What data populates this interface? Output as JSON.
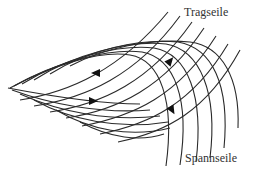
{
  "diagram": {
    "title": "",
    "labels": {
      "top": "Tragseile",
      "bottom": "Spannseile"
    },
    "colors": {
      "line": "#2a2a2a",
      "arrow": "#111111",
      "text": "#333333",
      "background": "#ffffff"
    },
    "tragseile_paths": [
      "M 10 88 C 60 92, 120 60, 170 10",
      "M 20 92 C 70 96, 130 68, 180 14",
      "M 30 96 C 80 100, 140 74, 192 20",
      "M 40 100 C 92 104, 150 82, 204 26",
      "M 54 104 C 104 108, 162 90, 214 34",
      "M 68 110 C 118 112, 176 98, 226 40",
      "M 84 116 C 132 118, 190 106, 238 50"
    ],
    "spannseile_paths": [
      "M 8 88 C 60 80, 130 40, 170 165",
      "M 8 88 C 60 74, 140 38, 182 164",
      "M 8 88 C 60 68, 150 36, 194 162",
      "M 8 88 C 60 62, 160 38, 204 158",
      "M 8 88 C 66 54, 170 42, 214 150",
      "M 8 88 C 76 46, 180 46, 226 138",
      "M 8 88 C 90 38, 196 50, 238 128"
    ],
    "lower_left_curves": [
      "M 8 88 C 60 96, 90 120, 120 128",
      "M 40 110 C 90 130, 150 126, 190 100",
      "M 60 118 C 110 134, 160 128, 200 110",
      "M 80 128 C 120 138, 160 132, 170 118"
    ],
    "arrows": [
      {
        "name": "arrow-upper-left",
        "x": 96,
        "y": 73,
        "direction": "left"
      },
      {
        "name": "arrow-upper-right",
        "x": 170,
        "y": 61,
        "direction": "up-right"
      },
      {
        "name": "arrow-lower-left",
        "x": 93,
        "y": 101,
        "direction": "right"
      },
      {
        "name": "arrow-lower-right",
        "x": 172,
        "y": 110,
        "direction": "down"
      }
    ]
  }
}
